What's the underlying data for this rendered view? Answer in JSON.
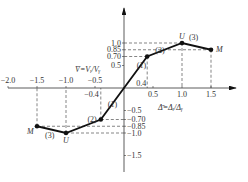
{
  "chart_data": {
    "type": "line",
    "title": "",
    "xlabel": "Δ̄=Δᵢ/Δᵧ",
    "ylabel": "V̄=Vᵢ/Vᵧ",
    "xlim": [
      -2.0,
      1.8
    ],
    "ylim": [
      -1.6,
      1.3
    ],
    "x_ticks": [
      {
        "v": -2.0,
        "label": "−2.0"
      },
      {
        "v": -1.5,
        "label": "−1.5"
      },
      {
        "v": -1.0,
        "label": "−1.0"
      },
      {
        "v": -0.5,
        "label": "−0.5"
      },
      {
        "v": 0.5,
        "label": "0.5"
      },
      {
        "v": 1.0,
        "label": "1.0"
      },
      {
        "v": 1.5,
        "label": "1.5"
      }
    ],
    "y_ticks_pos": [
      {
        "v": 1.0,
        "label": "1.0"
      },
      {
        "v": 0.85,
        "label": "0.85"
      },
      {
        "v": 0.7,
        "label": "0.70"
      },
      {
        "v": 0.5,
        "label": "0.5"
      }
    ],
    "y_ticks_neg": [
      {
        "v": -0.5,
        "label": "−0.5"
      },
      {
        "v": -0.7,
        "label": "−0.70"
      },
      {
        "v": -0.85,
        "label": "−0.85"
      },
      {
        "v": -1.0,
        "label": "−1.0"
      },
      {
        "v": -1.5,
        "label": "−1.5"
      }
    ],
    "extra_x_labels": [
      {
        "v": 0.4,
        "label": "0.4"
      },
      {
        "v": -0.4,
        "label": "−0.4"
      }
    ],
    "series": [
      {
        "name": "skeleton-curve",
        "points": [
          {
            "x": -1.5,
            "y": -0.85,
            "marker": true,
            "label": "M"
          },
          {
            "x": -1.0,
            "y": -1.0,
            "marker": true,
            "label": "U"
          },
          {
            "x": -0.4,
            "y": -0.7,
            "marker": true,
            "label": ""
          },
          {
            "x": 0.4,
            "y": 0.7,
            "marker": true,
            "label": ""
          },
          {
            "x": 1.0,
            "y": 1.0,
            "marker": true,
            "label": "U"
          },
          {
            "x": 1.5,
            "y": 0.85,
            "marker": true,
            "label": "M"
          }
        ]
      }
    ],
    "segment_labels": [
      {
        "x": 0.3,
        "y": 0.45,
        "label": "(1)"
      },
      {
        "x": 0.62,
        "y": 0.78,
        "label": "(2)"
      },
      {
        "x": 1.2,
        "y": 1.06,
        "label": "(3)"
      },
      {
        "x": -0.2,
        "y": -0.42,
        "label": "(1)"
      },
      {
        "x": -0.55,
        "y": -0.75,
        "label": "(2)"
      },
      {
        "x": -1.28,
        "y": -1.12,
        "label": "(3)"
      }
    ]
  }
}
